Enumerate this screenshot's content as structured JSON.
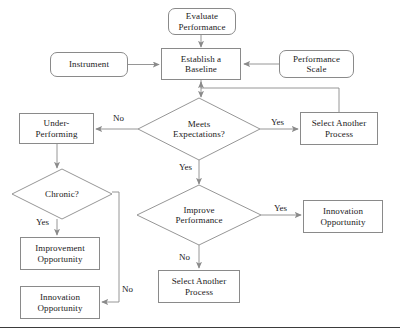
{
  "diagram": {
    "title_visible_fragment": "",
    "background_color": "#ffffff",
    "line_color": "#8a8a8a",
    "text_color": "#1a1a1a",
    "rule_color": "#3b3b3b",
    "width": 400,
    "height": 335
  },
  "nodes": {
    "evaluate_performance": {
      "label": "Evaluate\nPerformance",
      "line1": "Evaluate",
      "line2": "Performance",
      "shape": "rounded-rect",
      "x": 168,
      "y": 8,
      "w": 68,
      "h": 27
    },
    "instrument": {
      "label": "Instrument",
      "line1": "Instrument",
      "line2": "",
      "shape": "rounded-rect",
      "x": 50,
      "y": 52,
      "w": 78,
      "h": 25
    },
    "establish_baseline": {
      "label": "Establish a\nBaseline",
      "line1": "Establish a",
      "line2": "Baseline",
      "shape": "rect",
      "x": 161,
      "y": 48,
      "w": 80,
      "h": 32
    },
    "performance_scale": {
      "label": "Performance\nScale",
      "line1": "Performance",
      "line2": "Scale",
      "shape": "rounded-rect",
      "x": 279,
      "y": 50,
      "w": 75,
      "h": 28
    },
    "meets_expectations": {
      "label": "Meets\nExpectations?",
      "line1": "Meets",
      "line2": "Expectations?",
      "shape": "diamond",
      "cx": 199,
      "cy": 129,
      "rx": 61,
      "ry": 31
    },
    "under_performing": {
      "label": "Under-\nPerforming",
      "line1": "Under-",
      "line2": "Performing",
      "shape": "rect",
      "x": 19,
      "y": 113,
      "w": 75,
      "h": 31
    },
    "select_another_process_top": {
      "label": "Select Another\nProcess",
      "line1": "Select Another",
      "line2": "Process",
      "shape": "rect",
      "x": 300,
      "y": 112,
      "w": 78,
      "h": 33
    },
    "chronic": {
      "label": "Chronic?",
      "line1": "Chronic?",
      "line2": "",
      "shape": "diamond",
      "cx": 62,
      "cy": 194,
      "rx": 50,
      "ry": 25
    },
    "improve_performance": {
      "label": "Improve\nPerformance",
      "line1": "Improve",
      "line2": "Performance",
      "shape": "diamond",
      "cx": 199,
      "cy": 215,
      "rx": 62,
      "ry": 30
    },
    "innovation_opportunity_right": {
      "label": "Innovation\nOpportunity",
      "line1": "Innovation",
      "line2": "Opportunity",
      "shape": "rect",
      "x": 303,
      "y": 200,
      "w": 80,
      "h": 33
    },
    "improvement_opportunity": {
      "label": "Improvement\nOpportunity",
      "line1": "Improvement",
      "line2": "Opportunity",
      "shape": "rect",
      "x": 20,
      "y": 237,
      "w": 80,
      "h": 33
    },
    "select_another_process_bottom": {
      "label": "Select Another\nProcess",
      "line1": "Select Another",
      "line2": "Process",
      "shape": "rect",
      "x": 158,
      "y": 270,
      "w": 82,
      "h": 33
    },
    "innovation_opportunity_bottom": {
      "label": "Innovation\nOpportunity",
      "line1": "Innovation",
      "line2": "Opportunity",
      "shape": "rect",
      "x": 20,
      "y": 286,
      "w": 80,
      "h": 33
    }
  },
  "edge_labels": {
    "meets_no": {
      "text": "No",
      "x": 112,
      "y": 114
    },
    "meets_yes_right": {
      "text": "Yes",
      "x": 270,
      "y": 118
    },
    "meets_yes_down": {
      "text": "Yes",
      "x": 178,
      "y": 163
    },
    "chronic_yes": {
      "text": "Yes",
      "x": 35,
      "y": 218
    },
    "chronic_no": {
      "text": "No",
      "x": 121,
      "y": 285
    },
    "improve_yes": {
      "text": "Yes",
      "x": 273,
      "y": 204
    },
    "improve_no": {
      "text": "No",
      "x": 178,
      "y": 253
    }
  },
  "bottom_rule": {
    "y": 327
  }
}
